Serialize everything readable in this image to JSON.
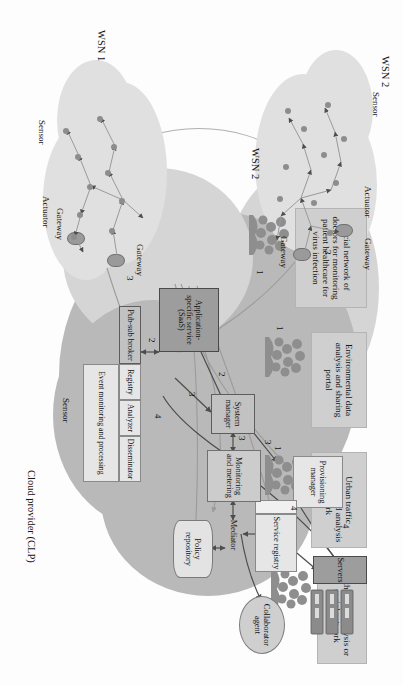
{
  "figure": {
    "orientation": "rotated-90-clockwise"
  },
  "consumers": [
    {
      "id": "other-data",
      "label": "Other data\nanalysis or\nsocial network",
      "icon": "people-group-icon",
      "link_number": "1"
    },
    {
      "id": "urban-traffic",
      "label": "Urban traffic\nprediction\nand\nanalysis network",
      "icon": "people-group-icon",
      "link_number": "1"
    },
    {
      "id": "environmental",
      "label": "Environmental\ndata analysis\nand\nsharing portal",
      "icon": "people-group-icon",
      "link_number": "1"
    },
    {
      "id": "social-doctors",
      "label": "Social network\nof doctors for\nmonitoring\npatient\nhealthcare for\nvirus infection",
      "icon": "people-group-icon",
      "link_number": "1"
    }
  ],
  "cloud": {
    "provider_label": "Cloud provider (CLP)",
    "sensor_label": "Sensor",
    "components": [
      {
        "id": "servers",
        "label": "Servers",
        "style": "dark"
      },
      {
        "id": "provisioning",
        "label": "Provisioning\nmanager",
        "style": "pale"
      },
      {
        "id": "service-registry",
        "label": "Service\nregistry",
        "style": "pale"
      },
      {
        "id": "system-manager",
        "label": "System\nmanager",
        "style": "mid"
      },
      {
        "id": "monitoring",
        "label": "Monitoring\nand metering",
        "style": "plain"
      },
      {
        "id": "mediator",
        "label": "Mediator",
        "style": "plain"
      },
      {
        "id": "collaborator",
        "label": "Collaborator\nagent",
        "style": "ellipse"
      },
      {
        "id": "policy-repo",
        "label": "Policy\nrepository",
        "style": "cylinder"
      },
      {
        "id": "saas",
        "label": "Application-specific\nservice\n(SaaS)",
        "style": "dark"
      },
      {
        "id": "pubsub",
        "label": "Pub-sub broker",
        "style": "mid"
      },
      {
        "id": "registry",
        "label": "Registry",
        "style": "pale"
      },
      {
        "id": "analyzer",
        "label": "Analyzer",
        "style": "pale"
      },
      {
        "id": "disseminator",
        "label": "Disseminator",
        "style": "pale"
      },
      {
        "id": "event-monitoring",
        "label": "Event\nmonitoring and\nprocessing",
        "style": "pale"
      }
    ]
  },
  "wsn": [
    {
      "id": "wsn1",
      "label": "WSN 1",
      "gateway_labels": [
        "Gateway",
        "Gateway"
      ],
      "sensor_label": "Sensor",
      "actuator_label": "Actuator",
      "link_number": "3"
    },
    {
      "id": "wsn2",
      "label": "WSN 2",
      "label_secondary": "WSN 2",
      "gateway_labels": [
        "Gateway",
        "Gateway"
      ],
      "sensor_label": "Sensor",
      "actuator_label": "Actuator",
      "link_number": "3"
    }
  ],
  "flow_numbers": {
    "consumer_to_saas": "1",
    "saas_to_system_manager": "2",
    "saas_to_pubsub": "2",
    "system_to_provisioning": "3",
    "system_to_monitoring": "3",
    "pubsub_to_system": "3",
    "gateway_to_pubsub": "3",
    "pubsub_to_monitoring": "4",
    "provisioning_to_servers": "4",
    "monitoring_to_servers": "4"
  },
  "colors": {
    "cloud_dark": "#b9b9b9",
    "cloud_light": "#d5d5d5",
    "box_user": "#cfcfcf",
    "box_dark": "#9d9d9d",
    "box_pale": "#e6e6e6",
    "text": "#151515"
  }
}
